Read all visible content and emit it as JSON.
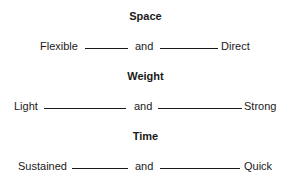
{
  "factors": [
    {
      "title": "Space",
      "left": "Flexible",
      "connector": "and",
      "right": "Direct"
    },
    {
      "title": "Weight",
      "left": "Light",
      "connector": "and",
      "right": "Strong"
    },
    {
      "title": "Time",
      "left": "Sustained",
      "connector": "and",
      "right": "Quick"
    }
  ]
}
